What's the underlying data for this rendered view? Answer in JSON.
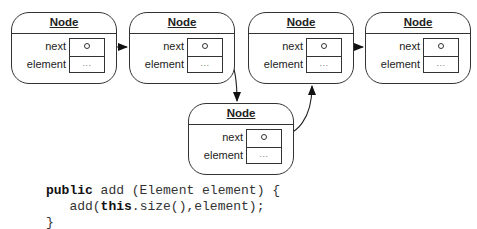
{
  "diagram": {
    "nodes": [
      {
        "id": "node-1",
        "title": "Node",
        "next_label": "next",
        "element_label": "element",
        "element_value": "..."
      },
      {
        "id": "node-2",
        "title": "Node",
        "next_label": "next",
        "element_label": "element",
        "element_value": "..."
      },
      {
        "id": "node-3",
        "title": "Node",
        "next_label": "next",
        "element_label": "element",
        "element_value": "..."
      },
      {
        "id": "node-4",
        "title": "Node",
        "next_label": "next",
        "element_label": "element",
        "element_value": "..."
      },
      {
        "id": "node-5",
        "title": "Node",
        "next_label": "next",
        "element_label": "element",
        "element_value": "..."
      }
    ],
    "edges": [
      {
        "from": "node-1",
        "to": "node-2"
      },
      {
        "from": "node-2",
        "to": "node-5"
      },
      {
        "from": "node-5",
        "to": "node-3"
      },
      {
        "from": "node-3",
        "to": "node-4"
      }
    ],
    "colors": {
      "stroke": "#333333",
      "background": "#ffffff"
    }
  },
  "code": {
    "line1_kw": "public",
    "line1_rest": " add (Element element) {",
    "line2_pre": "   add(",
    "line2_kw": "this",
    "line2_rest": ".size(),element);",
    "line3": "}"
  }
}
